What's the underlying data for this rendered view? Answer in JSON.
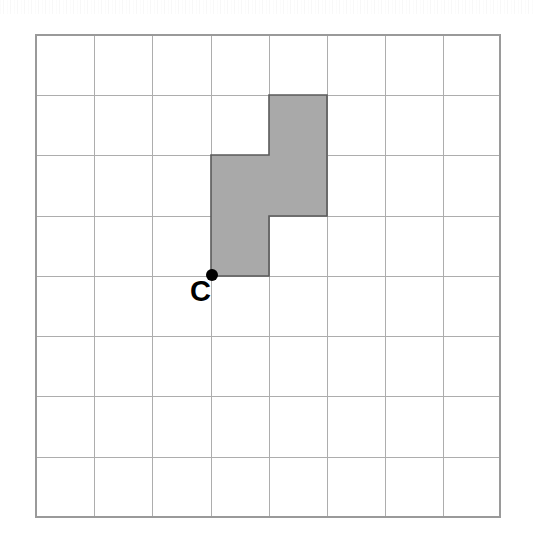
{
  "figure": {
    "title": "Coordinate grid with shaded S-tetromino and labelled point C",
    "canvas": {
      "width": 535,
      "height": 540,
      "background": "#ffffff"
    },
    "grid": {
      "columns": 8,
      "rows": 8,
      "origin_x": 36,
      "origin_y": 35,
      "cell_width": 58,
      "cell_height": 60.25,
      "line_color": "#adadad",
      "border_color": "#9a9a9a",
      "visible": true
    },
    "shape": {
      "name": "shaded-polyomino",
      "type": "S-tetromino",
      "cell_count": 4,
      "fill_color": "#a9a9a9",
      "outline_color": "#5a5a5a",
      "cells": [
        {
          "col": 4,
          "row": 1
        },
        {
          "col": 3,
          "row": 2
        },
        {
          "col": 4,
          "row": 2
        },
        {
          "col": 3,
          "row": 3
        }
      ],
      "outline_points": "4,1 5,1 5,3 4,3 4,4 3,4 3,2 4,2"
    },
    "points": [
      {
        "label": "C",
        "name": "point-c",
        "grid_col": 3,
        "grid_row": 4,
        "x": 211,
        "y": 275,
        "marker_radius": 5.5,
        "marker_color": "#000000",
        "label_x": 199,
        "label_y": 300
      }
    ]
  }
}
